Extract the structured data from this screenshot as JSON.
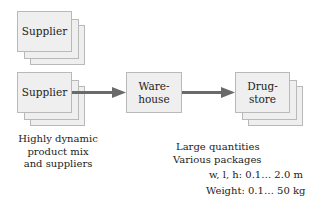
{
  "nodes": {
    "supplier_top": {
      "label": "Supplier"
    },
    "supplier_main": {
      "label": "Supplier"
    },
    "warehouse": {
      "line1": "Ware-",
      "line2": "house"
    },
    "drugstore": {
      "line1": "Drug-",
      "line2": "store"
    }
  },
  "annotations": {
    "supplier_note": [
      "Highly dynamic",
      "product mix",
      "and suppliers"
    ],
    "warehouse_note": [
      "Large quantities",
      "Various packages"
    ],
    "dimensions": "w, l, h: 0.1… 2.0 m",
    "weight": "Weight: 0.1… 50 kg"
  },
  "colors": {
    "box_fill": "#efefef",
    "box_border": "#b9b9b9",
    "arrow": "#6a6a6a"
  }
}
